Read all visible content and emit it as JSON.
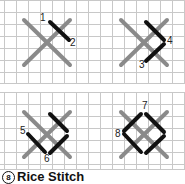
{
  "caption": {
    "number": "8",
    "title": "Rice Stitch"
  },
  "colors": {
    "grid": "#c8c8c8",
    "base_cross": "#8a8a8a",
    "stitch": "#111111",
    "label": "#222222"
  },
  "panels": [
    {
      "id": "step-1",
      "labels": [
        "1",
        "2"
      ]
    },
    {
      "id": "step-2",
      "labels": [
        "3",
        "4"
      ]
    },
    {
      "id": "step-3",
      "labels": [
        "5",
        "6"
      ]
    },
    {
      "id": "step-4",
      "labels": [
        "7",
        "8"
      ]
    }
  ]
}
